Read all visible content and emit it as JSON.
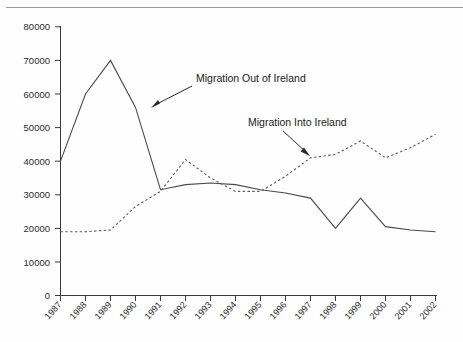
{
  "chart_data": {
    "type": "line",
    "title": "",
    "subtitle": "",
    "xlabel": "",
    "ylabel": "",
    "categories": [
      "1987",
      "1988",
      "1989",
      "1990",
      "1991",
      "1992",
      "1993",
      "1994",
      "1995",
      "1996",
      "1997",
      "1998",
      "1999",
      "2000",
      "2001",
      "2002"
    ],
    "ylim": [
      0,
      80000
    ],
    "y_ticks": [
      0,
      10000,
      20000,
      30000,
      40000,
      50000,
      60000,
      70000,
      80000
    ],
    "y_tick_labels": [
      "0",
      "10000",
      "20000",
      "30000",
      "40000",
      "50000",
      "60000",
      "70000",
      "80000"
    ],
    "grid": false,
    "legend_position": "annotations-inline",
    "series": [
      {
        "name": "Migration Out of Ireland",
        "style": "solid",
        "color": "#4a4a4a",
        "values": [
          40000,
          60000,
          70000,
          56000,
          31500,
          33000,
          33500,
          33000,
          31500,
          30500,
          29000,
          20000,
          29000,
          20500,
          19500,
          19000
        ]
      },
      {
        "name": "Migration Into Ireland",
        "style": "dashed",
        "color": "#5a5a5a",
        "values": [
          19000,
          19000,
          19500,
          26500,
          31000,
          40500,
          35000,
          31000,
          31000,
          35500,
          41000,
          42000,
          46000,
          41000,
          44000,
          48000
        ]
      }
    ],
    "annotations": [
      {
        "text": "Migration Out of Ireland",
        "target_series": "Migration Out of Ireland",
        "target_year": "1990",
        "target_value": 56000
      },
      {
        "text": "Migration Into Ireland",
        "target_series": "Migration Into Ireland",
        "target_year": "1997",
        "target_value": 41000
      }
    ]
  }
}
